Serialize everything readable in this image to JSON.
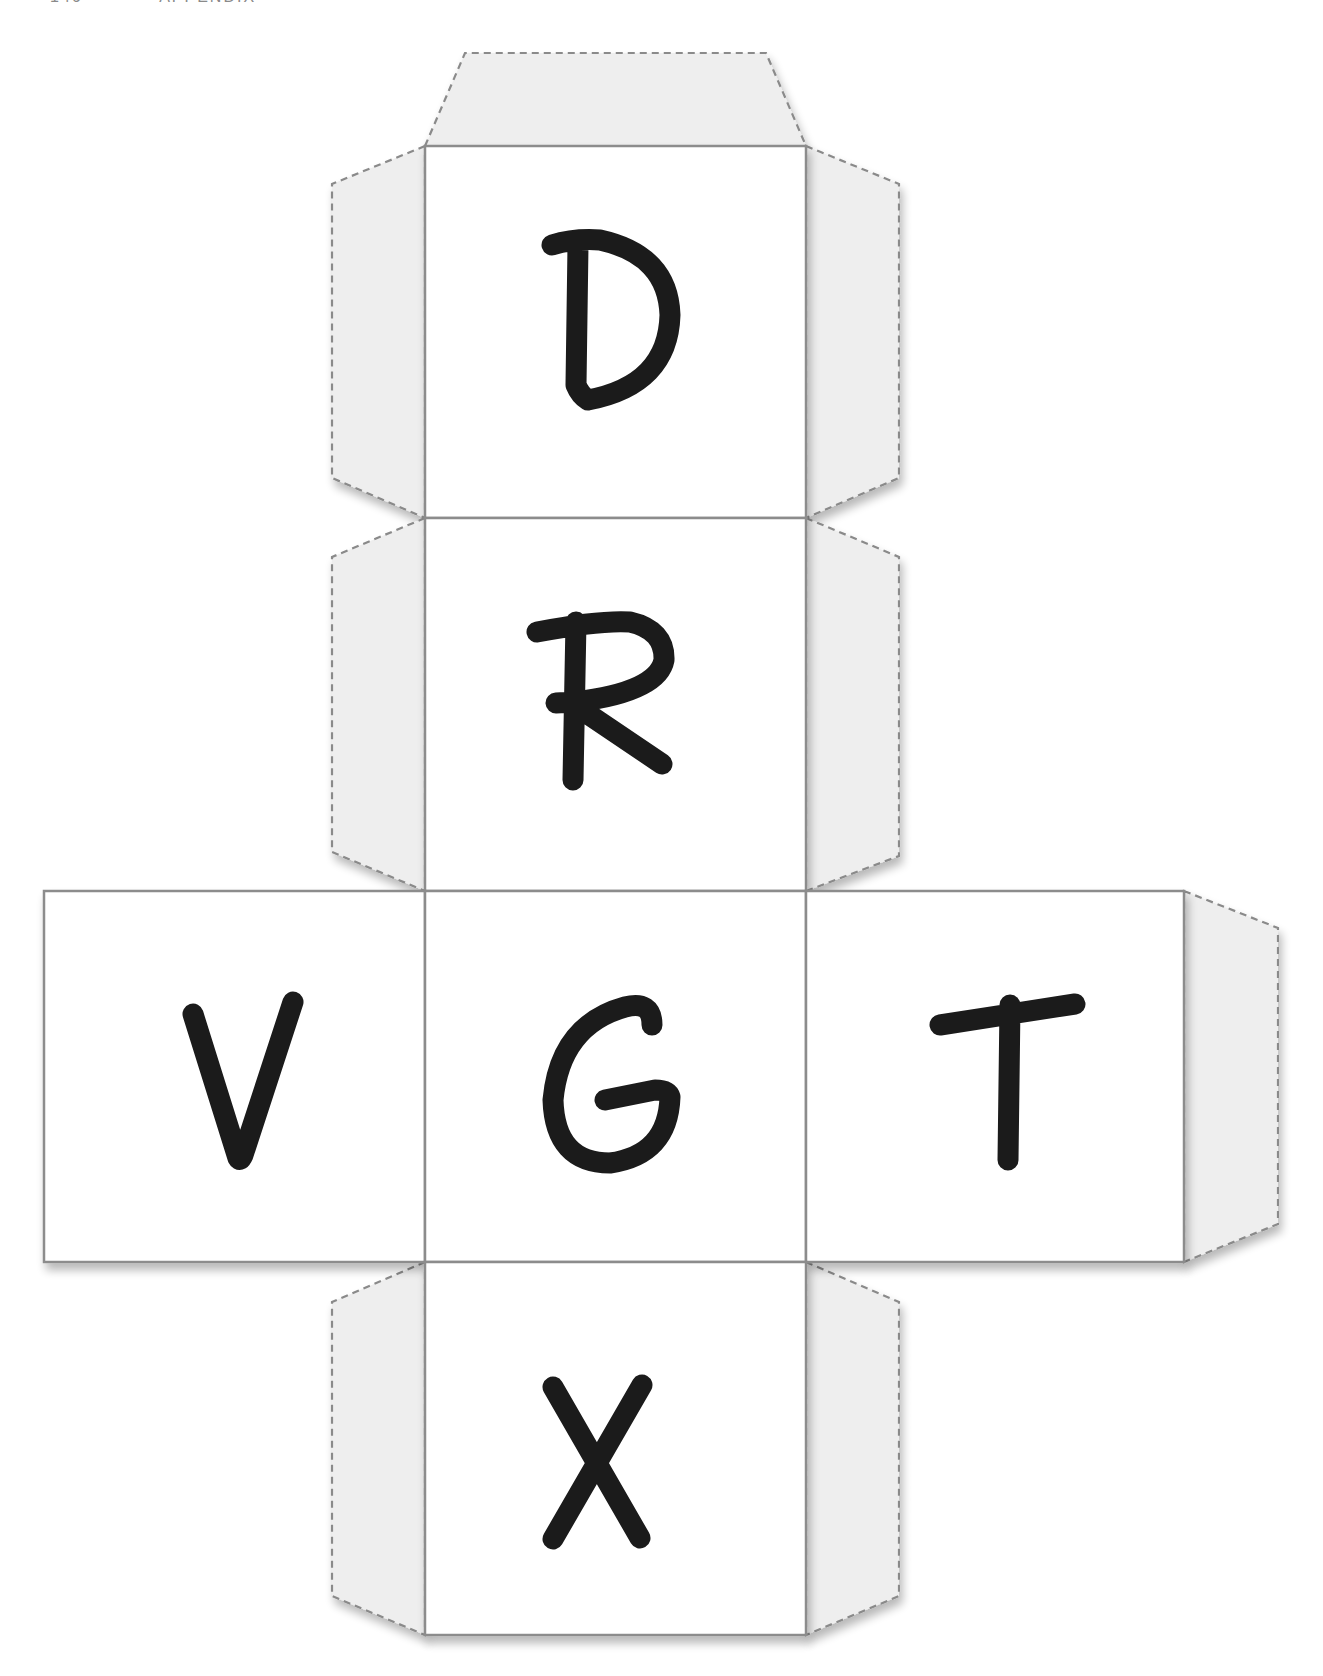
{
  "header": {
    "page_number": "146",
    "section": "APPENDIX"
  },
  "cube_net": {
    "title": "Letter cube cutout template",
    "colors": {
      "face_fill": "#ffffff",
      "face_stroke": "#8c8c8c",
      "flap_fill": "#eeeeee",
      "flap_stroke": "#8a8a8a",
      "letter_color": "#1b1b1b"
    },
    "faces": [
      {
        "id": "top",
        "letter": "D",
        "position": "column row 1"
      },
      {
        "id": "upper",
        "letter": "R",
        "position": "column row 2"
      },
      {
        "id": "left",
        "letter": "V",
        "position": "middle row left"
      },
      {
        "id": "center",
        "letter": "G",
        "position": "middle row center"
      },
      {
        "id": "right",
        "letter": "T",
        "position": "middle row right"
      },
      {
        "id": "bottom",
        "letter": "X",
        "position": "column row 4"
      }
    ],
    "flap_style": "dashed glue tabs"
  }
}
